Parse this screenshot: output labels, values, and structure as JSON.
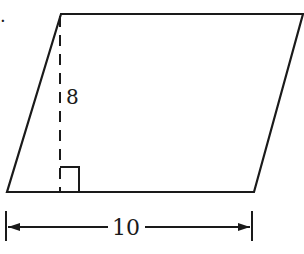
{
  "figure": {
    "problem_marker": ".",
    "shape": "parallelogram",
    "height_label": "8",
    "base_label": "10",
    "stroke_color": "#1a1a1a",
    "background": "#ffffff"
  }
}
